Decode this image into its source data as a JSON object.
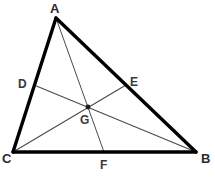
{
  "figure": {
    "kind": "geometry-diagram",
    "background_color": "#ffffff",
    "side_color": "#000000",
    "median_color": "#4a4a4a",
    "label_color": "#2b2b2b",
    "side_stroke_width": 3.2,
    "median_stroke_width": 1.0,
    "width": 215,
    "height": 192
  },
  "vertices": [
    {
      "id": "A",
      "label": "A",
      "x": 56,
      "y": 18,
      "label_x": 50,
      "label_y": 2
    },
    {
      "id": "B",
      "label": "B",
      "x": 196,
      "y": 152,
      "label_x": 201,
      "label_y": 152
    },
    {
      "id": "C",
      "label": "C",
      "x": 13,
      "y": 152,
      "label_x": 2,
      "label_y": 152
    }
  ],
  "midpoints": [
    {
      "id": "D",
      "label": "D",
      "x": 34,
      "y": 85,
      "label_x": 18,
      "label_y": 78,
      "on_side": "CA"
    },
    {
      "id": "E",
      "label": "E",
      "x": 126,
      "y": 85,
      "label_x": 130,
      "label_y": 76,
      "on_side": "AB"
    },
    {
      "id": "F",
      "label": "F",
      "x": 104,
      "y": 152,
      "label_x": 100,
      "label_y": 159,
      "on_side": "CB"
    }
  ],
  "centroid": {
    "id": "G",
    "label": "G",
    "x": 88,
    "y": 107,
    "label_x": 80,
    "label_y": 114,
    "dot_radius": 2.4
  },
  "sides": [
    {
      "name": "side-AB",
      "from": "A",
      "to": "B"
    },
    {
      "name": "side-BC",
      "from": "B",
      "to": "C"
    },
    {
      "name": "side-CA",
      "from": "C",
      "to": "A"
    }
  ],
  "medians": [
    {
      "name": "median-AF",
      "from": "A",
      "to": "F"
    },
    {
      "name": "median-BD",
      "from": "B",
      "to": "D"
    },
    {
      "name": "median-CE",
      "from": "C",
      "to": "E"
    }
  ],
  "caption": {
    "text": ""
  }
}
